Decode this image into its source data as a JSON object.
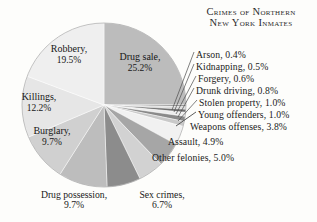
{
  "title": {
    "line1": "Crimes of Northern",
    "line2": "New York Inmates"
  },
  "chart_data": {
    "type": "pie",
    "title": "Crimes of Northern New York Inmates",
    "xlabel": "",
    "ylabel": "",
    "unit": "percent",
    "legend": "none",
    "grid": false,
    "start_angle_deg": 0,
    "direction": "clockwise",
    "categories": [
      "Drug sale",
      "Arson",
      "Kidnapping",
      "Forgery",
      "Drunk driving",
      "Stolen property",
      "Young offenders",
      "Weapons offenses",
      "Assault",
      "Other felonies",
      "Sex crimes",
      "Drug possession",
      "Burglary",
      "Killings",
      "Robbery"
    ],
    "values": [
      25.2,
      0.4,
      0.5,
      0.6,
      0.8,
      1.0,
      1.0,
      3.8,
      4.9,
      5.0,
      6.7,
      9.7,
      9.7,
      12.2,
      19.5
    ],
    "colors": [
      "#bcbcbc",
      "#8f8f8f",
      "#d9d9d9",
      "#6f6f6f",
      "#ededed",
      "#8a8a8a",
      "#c9c9c9",
      "#f1f1f1",
      "#a6a6a6",
      "#d2d2d2",
      "#8c8c8c",
      "#bdbdbd",
      "#d0d0d0",
      "#b4b4b4",
      "#e6e6e6",
      "#efefef"
    ],
    "slices": [
      {
        "label": "Drug sale",
        "value": 25.2,
        "text": "Drug sale,",
        "value_text": "25.2%",
        "placement": "inside",
        "color": "#bcbcbc"
      },
      {
        "label": "Arson",
        "value": 0.4,
        "text": "Arson,",
        "value_text": "0.4%",
        "placement": "callout",
        "color": "#8f8f8f"
      },
      {
        "label": "Kidnapping",
        "value": 0.5,
        "text": "Kidnapping,",
        "value_text": "0.5%",
        "placement": "callout",
        "color": "#d9d9d9"
      },
      {
        "label": "Forgery",
        "value": 0.6,
        "text": "Forgery,",
        "value_text": "0.6%",
        "placement": "callout",
        "color": "#6f6f6f"
      },
      {
        "label": "Drunk driving",
        "value": 0.8,
        "text": "Drunk driving,",
        "value_text": "0.8%",
        "placement": "callout",
        "color": "#ededed"
      },
      {
        "label": "Stolen property",
        "value": 1.0,
        "text": "Stolen property,",
        "value_text": "1.0%",
        "placement": "callout",
        "color": "#8a8a8a"
      },
      {
        "label": "Young offenders",
        "value": 1.0,
        "text": "Young offenders,",
        "value_text": "1.0%",
        "placement": "callout",
        "color": "#c9c9c9"
      },
      {
        "label": "Weapons offenses",
        "value": 3.8,
        "text": "Weapons offenses,",
        "value_text": "3.8%",
        "placement": "callout",
        "color": "#f1f1f1"
      },
      {
        "label": "Assault",
        "value": 4.9,
        "text": "Assault,",
        "value_text": "4.9%",
        "placement": "callout",
        "color": "#a6a6a6"
      },
      {
        "label": "Other felonies",
        "value": 5.0,
        "text": "Other felonies,",
        "value_text": "5.0%",
        "placement": "callout",
        "color": "#d2d2d2"
      },
      {
        "label": "Sex crimes",
        "value": 6.7,
        "text": "Sex crimes,",
        "value_text": "6.7%",
        "placement": "bottom",
        "color": "#8c8c8c"
      },
      {
        "label": "Drug possession",
        "value": 9.7,
        "text": "Drug possession,",
        "value_text": "9.7%",
        "placement": "bottom",
        "color": "#bdbdbd"
      },
      {
        "label": "Burglary",
        "value": 9.7,
        "text": "Burglary,",
        "value_text": "9.7%",
        "placement": "inside",
        "color": "#d0d0d0"
      },
      {
        "label": "Killings",
        "value": 12.2,
        "text": "Killings,",
        "value_text": "12.2%",
        "placement": "inside",
        "color": "#e6e6e6"
      },
      {
        "label": "Robbery",
        "value": 19.5,
        "text": "Robbery,",
        "value_text": "19.5%",
        "placement": "inside",
        "color": "#efefef"
      }
    ]
  },
  "labels": {
    "arson": "Arson, 0.4%",
    "kidnapping": "Kidnapping, 0.5%",
    "forgery": "Forgery, 0.6%",
    "drunk": "Drunk driving, 0.8%",
    "stolen": "Stolen property, 1.0%",
    "young": "Young offenders, 1.0%",
    "weapons": "Weapons offenses, 3.8%",
    "assault": "Assault, 4.9%",
    "otherfel": "Other felonies, 5.0%",
    "drugposs_name": "Drug possession,",
    "drugposs_val": "9.7%",
    "sex_name": "Sex crimes,",
    "sex_val": "6.7%",
    "robbery_name": "Robbery,",
    "robbery_val": "19.5%",
    "drugsale_name": "Drug sale,",
    "drugsale_val": "25.2%",
    "killings_name": "Killings,",
    "killings_val": "12.2%",
    "burglary_name": "Burglary,",
    "burglary_val": "9.7%"
  }
}
